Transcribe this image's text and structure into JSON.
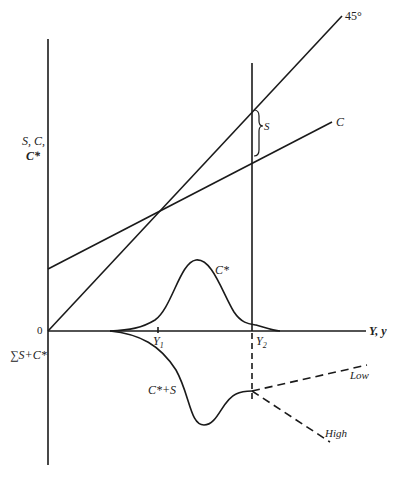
{
  "diagram": {
    "type": "economics-diagram",
    "y_axis_label_line1": "S, C,",
    "y_axis_label_line2": "C*",
    "origin_label": "0",
    "lower_axis_label": "∑S+C*",
    "x_axis_label": "Y, y",
    "line_45_label": "45°",
    "consumption_label": "C",
    "saving_brace_label": "S",
    "cstar_curve_label": "C*",
    "cstar_plus_s_label": "C*+S",
    "y1_label": "Y",
    "y1_sub": "1",
    "y2_label": "Y",
    "y2_sub": "2",
    "low_label": "Low",
    "high_label": "High"
  },
  "colors": {
    "line": "#1a1a1a",
    "background": "#ffffff"
  }
}
